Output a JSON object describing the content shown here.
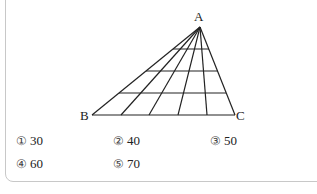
{
  "figure": {
    "vertex_labels": {
      "A": "A",
      "B": "B",
      "C": "C"
    },
    "lines_from_apex": 6,
    "horizontal_lines": 4
  },
  "choices": [
    {
      "num": "①",
      "value": "30"
    },
    {
      "num": "②",
      "value": "40"
    },
    {
      "num": "③",
      "value": "50"
    },
    {
      "num": "④",
      "value": "60"
    },
    {
      "num": "⑤",
      "value": "70"
    }
  ]
}
